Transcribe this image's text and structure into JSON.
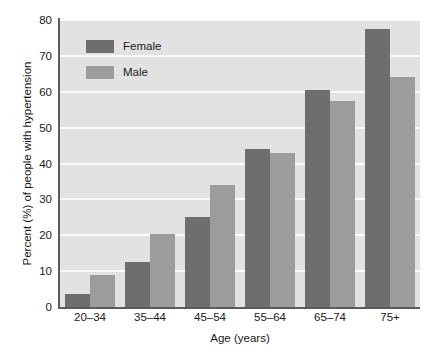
{
  "chart_data": {
    "type": "bar",
    "title": "",
    "subtitle": "",
    "xlabel": "Age (years)",
    "ylabel": "Percent (%) of people with hypertension",
    "categories": [
      "20–34",
      "35–44",
      "45–54",
      "55–64",
      "65–74",
      "75+"
    ],
    "series": [
      {
        "name": "Female",
        "color": "#6e6e6e",
        "values": [
          3.6,
          12.5,
          25.0,
          44.0,
          60.5,
          77.5
        ]
      },
      {
        "name": "Male",
        "color": "#9c9c9c",
        "values": [
          8.8,
          20.3,
          34.0,
          43.0,
          57.5,
          64.0
        ]
      }
    ],
    "ylim": [
      0,
      80
    ],
    "yticks": [
      0,
      10,
      20,
      30,
      40,
      50,
      60,
      70,
      80
    ],
    "ytick_labels": [
      "0",
      "10",
      "20",
      "30",
      "40",
      "50",
      "60",
      "70",
      "80"
    ],
    "grid": true,
    "grid_axis": "y",
    "grid_color": "#fafafa",
    "legend_position": "upper-left-inside",
    "plot_background": "#e2e2e2",
    "figure_background": "#ffffff",
    "axis_color": "#5b5b5b",
    "text_color": "#1a1a1a"
  },
  "legend": {
    "items": [
      {
        "label": "Female"
      },
      {
        "label": "Male"
      }
    ]
  }
}
